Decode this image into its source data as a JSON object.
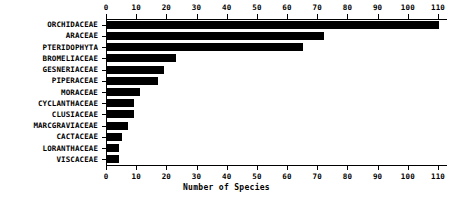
{
  "chart_data": {
    "type": "bar",
    "orientation": "horizontal",
    "title": "",
    "subtitle": "",
    "xlabel": "Number of Species",
    "ylabel": "",
    "xlim": [
      0,
      113
    ],
    "ylim": null,
    "grid": false,
    "legend": null,
    "legend_position": "none",
    "x_ticks": [
      0,
      10,
      20,
      30,
      40,
      50,
      60,
      70,
      80,
      90,
      100,
      110
    ],
    "x_tick_labels": [
      "0",
      "10",
      "20",
      "30",
      "40",
      "50",
      "60",
      "70",
      "80",
      "90",
      "100",
      "110"
    ],
    "top_axis": true,
    "bottom_axis": true,
    "categories": [
      "ORCHIDACEAE",
      "ARACEAE",
      "PTERIDOPHYTA",
      "BROMELIACEAE",
      "GESNERIACEAE",
      "PIPERACEAE",
      "MORACEAE",
      "CYCLANTHACEAE",
      "CLUSIACEAE",
      "MARCGRAVIACEAE",
      "CACTACEAE",
      "LORANTHACEAE",
      "VISCACEAE"
    ],
    "values": [
      110,
      72,
      65,
      23,
      19,
      17,
      11,
      9,
      9,
      7,
      5,
      4,
      4
    ],
    "bar_color": "#000000",
    "background_color": "#ffffff"
  },
  "axis": {
    "x_title": "Number of Species"
  }
}
